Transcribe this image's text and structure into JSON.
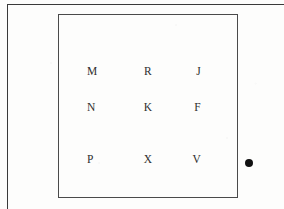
{
  "figure": {
    "background_color": "#fdfdfc",
    "outer_frame": {
      "name": "outer page rule",
      "border_color": "#3a3a3a"
    },
    "inner_box": {
      "name": "letter grid box",
      "border_color": "#4a4a4a"
    },
    "marker": {
      "name": "filled dot",
      "shape": "circle",
      "color": "#111111"
    },
    "grid": {
      "rows": 3,
      "columns": 3,
      "letters": [
        [
          "M",
          "R",
          "J"
        ],
        [
          "N",
          "K",
          "F"
        ],
        [
          "P",
          "X",
          "V"
        ]
      ]
    }
  }
}
